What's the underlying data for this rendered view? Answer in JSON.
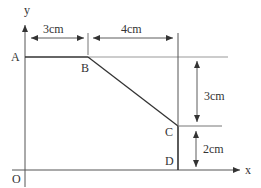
{
  "diagram": {
    "axes": {
      "x_label": "x",
      "y_label": "y",
      "origin_label": "O"
    },
    "points": {
      "A": "A",
      "B": "B",
      "C": "C",
      "D": "D"
    },
    "dimensions": {
      "ab_width": "3cm",
      "bd_width": "4cm",
      "bc_drop": "3cm",
      "cd_height": "2cm"
    },
    "colors": {
      "line": "#333333",
      "thin_line": "#888888",
      "background": "#ffffff"
    }
  }
}
